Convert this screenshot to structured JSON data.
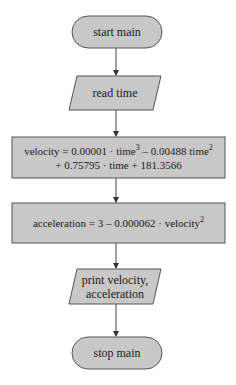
{
  "diagram": {
    "type": "flowchart",
    "colors": {
      "fill": "#c8c8c8",
      "stroke": "#555555",
      "text": "#1a1a1a",
      "background": "#ffffff"
    },
    "nodes": [
      {
        "id": "start",
        "shape": "terminator",
        "label": "start main"
      },
      {
        "id": "read",
        "shape": "parallelogram",
        "label": "read time"
      },
      {
        "id": "velocity",
        "shape": "process",
        "line1": {
          "a": "velocity = 0.00001 · time",
          "sup1": "3",
          "b": " – 0.00488 time",
          "sup2": "2"
        },
        "line2": "+ 0.75795 · time + 181.3566"
      },
      {
        "id": "acceleration",
        "shape": "process",
        "line1": {
          "a": "acceleration = 3 – 0.000062 · velocity",
          "sup1": "2"
        }
      },
      {
        "id": "print",
        "shape": "parallelogram",
        "line1": "print velocity,",
        "line2": "acceleration"
      },
      {
        "id": "stop",
        "shape": "terminator",
        "label": "stop main"
      }
    ],
    "edges": [
      {
        "from": "start",
        "to": "read"
      },
      {
        "from": "read",
        "to": "velocity"
      },
      {
        "from": "velocity",
        "to": "acceleration"
      },
      {
        "from": "acceleration",
        "to": "print"
      },
      {
        "from": "print",
        "to": "stop"
      }
    ]
  }
}
